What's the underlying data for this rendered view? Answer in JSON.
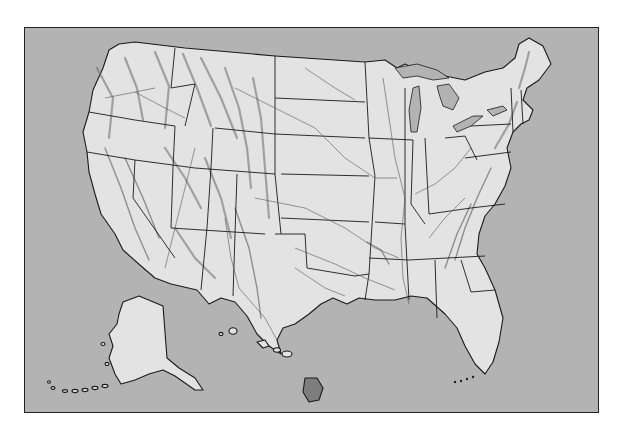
{
  "map": {
    "title": "",
    "subject": "Shaded relief map of the United States",
    "regions": [
      "Contiguous United States",
      "Alaska",
      "Hawaii"
    ],
    "features": [
      "state-borders",
      "rivers",
      "great-lakes",
      "mountain-relief-shading"
    ],
    "colors": {
      "water": "#b3b3b3",
      "land": "#e3e3e3",
      "border": "#1a1a1a",
      "relief": "#6a6a6a",
      "page": "#ffffff"
    }
  }
}
